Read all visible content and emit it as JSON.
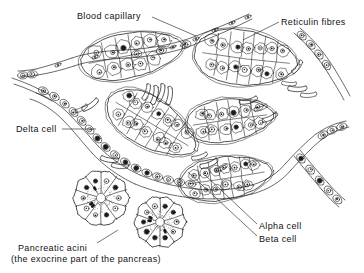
{
  "figure": {
    "background_color": "#ffffff",
    "ink_color": "#1a1a1a"
  },
  "labels": [
    {
      "id": "blood-capillary",
      "text": "Blood capillary",
      "x": 77,
      "y": 11,
      "align": "left"
    },
    {
      "id": "reticulin-fibres",
      "text": "Reticulin fibres",
      "x": 281,
      "y": 17,
      "align": "left"
    },
    {
      "id": "delta-cell",
      "text": "Delta cell",
      "x": 16,
      "y": 124,
      "align": "left"
    },
    {
      "id": "alpha-cell",
      "text": "Alpha cell",
      "x": 259,
      "y": 221,
      "align": "left"
    },
    {
      "id": "beta-cell",
      "text": "Beta cell",
      "x": 259,
      "y": 234,
      "align": "left"
    },
    {
      "id": "pancreatic-acini-line1",
      "text": "Pancreatic acini",
      "x": 18,
      "y": 243,
      "align": "left"
    },
    {
      "id": "pancreatic-acini-line2",
      "text": "(the exocrine part of the pancreas)",
      "x": 11,
      "y": 254,
      "align": "left"
    }
  ],
  "leader_lines": [
    {
      "id": "leader-blood-capillary",
      "from": [
        152,
        17
      ],
      "to": [
        196,
        36
      ]
    },
    {
      "id": "leader-reticulin-fibres",
      "from": [
        279,
        22
      ],
      "to": [
        243,
        40
      ]
    },
    {
      "id": "leader-delta-cell",
      "from": [
        62,
        129
      ],
      "to": [
        96,
        129
      ]
    },
    {
      "id": "leader-alpha-cell",
      "from": [
        257,
        224
      ],
      "to": [
        205,
        175
      ]
    },
    {
      "id": "leader-beta-cell",
      "from": [
        257,
        236
      ],
      "to": [
        188,
        172
      ]
    },
    {
      "id": "leader-pancreatic-acini",
      "from": [
        97,
        243
      ],
      "to": [
        118,
        230
      ]
    }
  ],
  "structures": {
    "islet_clusters": [
      {
        "id": "cluster-upper-left",
        "cx": 132,
        "cy": 55,
        "rx": 52,
        "ry": 22,
        "rot": -11,
        "cells": 11
      },
      {
        "id": "cluster-upper-right",
        "cx": 246,
        "cy": 58,
        "rx": 52,
        "ry": 27,
        "rot": 7,
        "cells": 14
      },
      {
        "id": "cluster-center-left",
        "cx": 152,
        "cy": 124,
        "rx": 50,
        "ry": 24,
        "rot": 31,
        "cells": 14
      },
      {
        "id": "cluster-center-right",
        "cx": 230,
        "cy": 120,
        "rx": 44,
        "ry": 21,
        "rot": -8,
        "cells": 12
      },
      {
        "id": "cluster-lower-right",
        "cx": 226,
        "cy": 178,
        "rx": 46,
        "ry": 21,
        "rot": -9,
        "cells": 13
      }
    ],
    "acini": [
      {
        "id": "acinus-left",
        "cx": 101,
        "cy": 198,
        "r": 27,
        "cells": 10
      },
      {
        "id": "acinus-right",
        "cx": 160,
        "cy": 222,
        "r": 25,
        "cells": 10
      }
    ],
    "capillaries": [
      {
        "id": "capillary-top",
        "description": "long vessel crossing upper field"
      },
      {
        "id": "capillary-left",
        "description": "vessel descending at left margin"
      },
      {
        "id": "capillary-mid",
        "description": "vessel sweeping through centre"
      },
      {
        "id": "capillary-right",
        "description": "vessel at right margin"
      }
    ],
    "reticulin_fibre_count": 18,
    "cell_types": [
      "Alpha cell",
      "Beta cell",
      "Delta cell"
    ]
  }
}
